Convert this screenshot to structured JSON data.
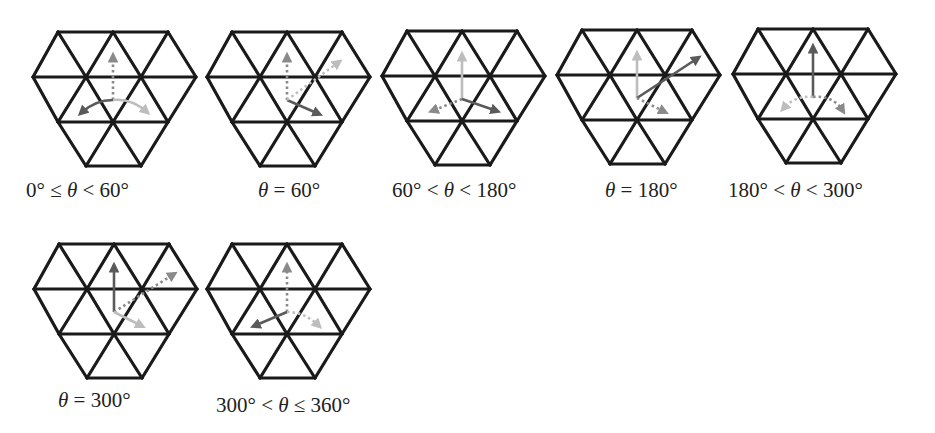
{
  "colors": {
    "grid": "#1a1a1a",
    "arrow_dark": "#5a5a5a",
    "arrow_mid": "#8a8a8a",
    "arrow_light": "#bdbdbd",
    "text": "#222222"
  },
  "grid": {
    "vertices_rows": [
      {
        "y": 0,
        "x": [
          25,
          80,
          135
        ]
      },
      {
        "y": 45,
        "x": [
          0,
          53,
          108,
          163
        ]
      },
      {
        "y": 90,
        "x": [
          25,
          80,
          135
        ]
      },
      {
        "y": 134,
        "x": [
          53,
          108
        ]
      }
    ],
    "origin": [
      80,
      68
    ]
  },
  "figures": [
    {
      "id": "fig-0-60",
      "pos": [
        33,
        32
      ],
      "caption": "0° ≤ θ < 60°",
      "caption_pos": [
        26,
        178
      ],
      "arrows": [
        {
          "to": [
            80,
            24
          ],
          "shade": "arrow_mid",
          "style": "dotted"
        },
        {
          "to": [
            48,
            81
          ],
          "shade": "arrow_dark",
          "style": "solid",
          "curve": [
            62,
            68
          ]
        },
        {
          "to": [
            114,
            80
          ],
          "shade": "arrow_light",
          "style": "solid",
          "curve": [
            98,
            66
          ]
        }
      ]
    },
    {
      "id": "fig-60",
      "pos": [
        207,
        32
      ],
      "caption": "θ = 60°",
      "caption_pos": [
        258,
        178
      ],
      "arrows": [
        {
          "to": [
            80,
            24
          ],
          "shade": "arrow_mid",
          "style": "dotted"
        },
        {
          "to": [
            112,
            82
          ],
          "shade": "arrow_dark",
          "style": "solid"
        },
        {
          "to": [
            132,
            30
          ],
          "shade": "arrow_light",
          "style": "dotted"
        }
      ]
    },
    {
      "id": "fig-60-180",
      "pos": [
        382,
        31
      ],
      "caption": "60° < θ < 180°",
      "caption_pos": [
        392,
        178
      ],
      "arrows": [
        {
          "to": [
            80,
            24
          ],
          "shade": "arrow_light",
          "style": "solid"
        },
        {
          "to": [
            50,
            80
          ],
          "shade": "arrow_mid",
          "style": "dotted"
        },
        {
          "to": [
            115,
            80
          ],
          "shade": "arrow_dark",
          "style": "solid"
        }
      ]
    },
    {
      "id": "fig-180",
      "pos": [
        557,
        30
      ],
      "caption": "θ = 180°",
      "caption_pos": [
        605,
        178
      ],
      "arrows": [
        {
          "to": [
            80,
            24
          ],
          "shade": "arrow_light",
          "style": "solid"
        },
        {
          "to": [
            141,
            28
          ],
          "shade": "arrow_dark",
          "style": "solid"
        },
        {
          "to": [
            108,
            82
          ],
          "shade": "arrow_mid",
          "style": "dotted"
        }
      ]
    },
    {
      "id": "fig-180-300",
      "pos": [
        733,
        29
      ],
      "caption": "180° < θ < 300°",
      "caption_pos": [
        728,
        178
      ],
      "arrows": [
        {
          "to": [
            80,
            18
          ],
          "shade": "arrow_dark",
          "style": "solid"
        },
        {
          "to": [
            50,
            80
          ],
          "shade": "arrow_light",
          "style": "dotted",
          "curve": [
            62,
            66
          ]
        },
        {
          "to": [
            110,
            82
          ],
          "shade": "arrow_mid",
          "style": "dotted",
          "curve": [
            100,
            66
          ]
        }
      ]
    },
    {
      "id": "fig-300",
      "pos": [
        34,
        244
      ],
      "caption": "θ = 300°",
      "caption_pos": [
        58,
        388
      ],
      "arrows": [
        {
          "to": [
            80,
            22
          ],
          "shade": "arrow_dark",
          "style": "solid"
        },
        {
          "to": [
            140,
            30
          ],
          "shade": "arrow_mid",
          "style": "dotted"
        },
        {
          "to": [
            108,
            82
          ],
          "shade": "arrow_light",
          "style": "solid"
        }
      ]
    },
    {
      "id": "fig-300-360",
      "pos": [
        207,
        244
      ],
      "caption": "300° < θ ≤ 360°",
      "caption_pos": [
        216,
        393
      ],
      "arrows": [
        {
          "to": [
            80,
            22
          ],
          "shade": "arrow_mid",
          "style": "dotted"
        },
        {
          "to": [
            47,
            82
          ],
          "shade": "arrow_dark",
          "style": "solid"
        },
        {
          "to": [
            112,
            82
          ],
          "shade": "arrow_light",
          "style": "dotted",
          "curve": [
            98,
            68
          ]
        }
      ]
    }
  ]
}
